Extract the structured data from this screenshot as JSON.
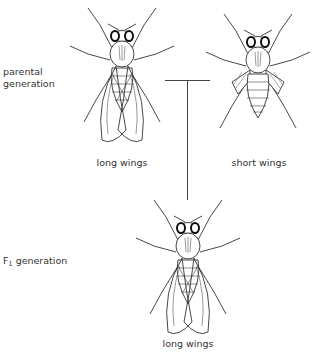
{
  "diagram": {
    "rows": [
      {
        "label_line1": "parental",
        "label_line2": "generation"
      },
      {
        "label_prefix": "F",
        "label_sub": "1",
        "label_suffix": " generation"
      }
    ],
    "parents": [
      {
        "phenotype": "long wings",
        "icon": "fruit-fly-long-wings"
      },
      {
        "phenotype": "short wings",
        "icon": "fruit-fly-short-wings"
      }
    ],
    "offspring": [
      {
        "phenotype": "long wings",
        "icon": "fruit-fly-long-wings"
      }
    ],
    "colors": {
      "line": "#444444",
      "text": "#333333",
      "background": "#ffffff"
    }
  }
}
